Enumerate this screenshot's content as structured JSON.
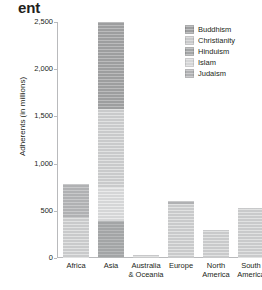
{
  "title_fragment": "ent",
  "legend": {
    "position": "top-right",
    "entries": [
      {
        "label": "Buddhism",
        "color": "#9d9e9f",
        "swatch": "legend-swatch-buddhism"
      },
      {
        "label": "Christianity",
        "color": "#c9cacb",
        "swatch": "legend-swatch-christianity"
      },
      {
        "label": "Hinduism",
        "color": "#a3a5a6",
        "swatch": "legend-swatch-hinduism"
      },
      {
        "label": "Islam",
        "color": "#d5d6d7",
        "swatch": "legend-swatch-islam"
      },
      {
        "label": "Judaism",
        "color": "#b0b1b3",
        "swatch": "legend-swatch-judaism"
      }
    ]
  },
  "axis": {
    "y_ticks": [
      "2,500",
      "2,000",
      "1,500",
      "1,000",
      "500",
      "0"
    ],
    "y_tick_values": [
      2500,
      2000,
      1500,
      1000,
      500,
      0
    ]
  },
  "chart_data": {
    "type": "bar",
    "subtype": "stacked",
    "title": "ent",
    "xlabel": "",
    "ylabel": "Adherents (in millions)",
    "ylim": [
      0,
      2500
    ],
    "ytick_values": [
      0,
      500,
      1000,
      1500,
      2000,
      2500
    ],
    "ytick_labels": [
      "0",
      "500",
      "1,000",
      "1,500",
      "2,000",
      "2,500"
    ],
    "grid": false,
    "legend": "top-right",
    "categories": [
      "Africa",
      "Asia",
      "Australia & Oceania",
      "Europe",
      "North America",
      "South America"
    ],
    "series": [
      {
        "name": "Buddhism",
        "color": "#9d9e9f",
        "values": [
          0,
          390,
          0,
          0,
          0,
          0
        ]
      },
      {
        "name": "Christianity",
        "color": "#c9cacb",
        "values": [
          420,
          0,
          18,
          575,
          285,
          520
        ]
      },
      {
        "name": "Hinduism",
        "color": "#a3a5a6",
        "values": [
          0,
          350,
          0,
          0,
          0,
          0
        ]
      },
      {
        "name": "Islam",
        "color": "#d5d6d7",
        "values": [
          0,
          840,
          0,
          0,
          0,
          0
        ]
      },
      {
        "name": "Judaism",
        "color": "#b0b1b3",
        "values": [
          360,
          920,
          12,
          25,
          10,
          5
        ]
      }
    ],
    "totals": [
      780,
      2500,
      30,
      600,
      295,
      525
    ],
    "stack_order_bottom_to_top": [
      "Buddhism",
      "Hinduism",
      "Islam",
      "Christianity",
      "Judaism"
    ]
  },
  "bars": [
    {
      "category": "Africa",
      "label": "Africa",
      "total": 780,
      "left": 6,
      "segments": [
        {
          "series": "Christianity",
          "class": "christianity",
          "value": 420
        },
        {
          "series": "Judaism",
          "class": "judaism",
          "value": 360
        }
      ]
    },
    {
      "category": "Asia",
      "label": "Asia",
      "total": 2500,
      "left": 41,
      "segments": [
        {
          "series": "Hinduism",
          "class": "hinduism",
          "value": 390
        },
        {
          "series": "Islam",
          "class": "islam",
          "value": 350
        },
        {
          "series": "Christianity",
          "class": "christianity",
          "value": 840
        },
        {
          "series": "Buddhism",
          "class": "buddhism",
          "value": 920
        }
      ]
    },
    {
      "category": "Australia & Oceania",
      "label": "Australia\n& Oceania",
      "label_line1": "Australia",
      "label_line2": "& Oceania",
      "total": 30,
      "left": 76,
      "segments": [
        {
          "series": "Christianity",
          "class": "christianity",
          "value": 18
        },
        {
          "series": "Judaism",
          "class": "judaism",
          "value": 12
        }
      ]
    },
    {
      "category": "Europe",
      "label": "Europe",
      "total": 600,
      "left": 111,
      "segments": [
        {
          "series": "Christianity",
          "class": "christianity",
          "value": 575
        },
        {
          "series": "Judaism",
          "class": "judaism",
          "value": 25
        }
      ]
    },
    {
      "category": "North America",
      "label": "North\nAmerica",
      "label_line1": "North",
      "label_line2": "America",
      "total": 295,
      "left": 146,
      "segments": [
        {
          "series": "Christianity",
          "class": "christianity",
          "value": 285
        },
        {
          "series": "Judaism",
          "class": "judaism",
          "value": 10
        }
      ]
    },
    {
      "category": "South America",
      "label": "South\nAmerica",
      "label_line1": "South",
      "label_line2": "America",
      "total": 525,
      "left": 181,
      "segments": [
        {
          "series": "Christianity",
          "class": "christianity",
          "value": 520
        },
        {
          "series": "Judaism",
          "class": "judaism",
          "value": 5
        }
      ]
    }
  ]
}
